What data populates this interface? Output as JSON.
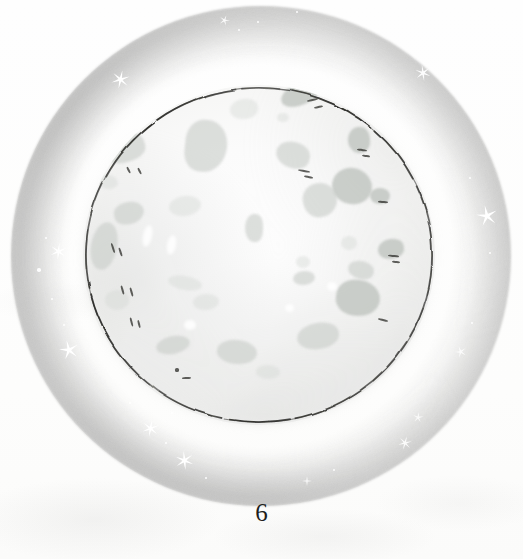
{
  "page": {
    "kind": "book-illustration",
    "number": "6",
    "background_color": "#fdfdfc"
  },
  "illustration": {
    "subject": "full-moon",
    "title_text": "",
    "caption_text": "",
    "palette": {
      "paper": "#fdfdfc",
      "halo_outer": "#acacac",
      "halo_mid": "#b4b4b4",
      "disc_fill": "#fbfbfb",
      "disc_edge": "#e6e6e4",
      "crater_gray": "#c9cdc9",
      "crater_dark": "#bcc1bc",
      "ink_line": "#2b2b28",
      "star_white": "#ffffff",
      "page_number_color": "#1e1e1c"
    },
    "halo": {
      "cx": 261,
      "cy": 256,
      "r": 250,
      "inner_r": 140
    },
    "disc": {
      "cx": 259,
      "cy": 255,
      "rx": 176,
      "ry": 170
    },
    "outline": {
      "stroke": "#2b2b28",
      "width": 1.6,
      "style": "hand-drawn-broken-ink"
    },
    "craters": [
      {
        "name": "crater-upper-left-large",
        "x": 122,
        "y": 148,
        "w": 46,
        "h": 30,
        "r": "48% 52% 40% 60%",
        "rot": -18,
        "tone": ""
      },
      {
        "name": "crater-upper-left-small",
        "x": 108,
        "y": 182,
        "w": 20,
        "h": 14,
        "r": "50%",
        "rot": 8,
        "tone": "light"
      },
      {
        "name": "crater-top-mid",
        "x": 206,
        "y": 146,
        "w": 42,
        "h": 52,
        "r": "46% 54% 58% 42%",
        "rot": 6,
        "tone": ""
      },
      {
        "name": "crater-top-center-small",
        "x": 244,
        "y": 109,
        "w": 28,
        "h": 20,
        "r": "52% 48% 46% 54%",
        "rot": -10,
        "tone": "light"
      },
      {
        "name": "crater-top-right-long",
        "x": 300,
        "y": 94,
        "w": 40,
        "h": 22,
        "r": "56% 44% 50% 50%",
        "rot": -22,
        "tone": "dark"
      },
      {
        "name": "crater-top-right-tiny",
        "x": 283,
        "y": 117,
        "w": 12,
        "h": 9,
        "r": "50%",
        "rot": 0,
        "tone": "light"
      },
      {
        "name": "crater-right-upper",
        "x": 293,
        "y": 155,
        "w": 34,
        "h": 26,
        "r": "50% 50% 44% 56%",
        "rot": 14,
        "tone": ""
      },
      {
        "name": "crater-right-ink",
        "x": 359,
        "y": 140,
        "w": 22,
        "h": 26,
        "r": "54% 46% 48% 52%",
        "rot": -6,
        "tone": "dark"
      },
      {
        "name": "crater-right-big",
        "x": 352,
        "y": 186,
        "w": 40,
        "h": 36,
        "r": "50% 52% 48% 50%",
        "rot": 10,
        "tone": "dark"
      },
      {
        "name": "crater-mid-left-blob",
        "x": 129,
        "y": 213,
        "w": 30,
        "h": 22,
        "r": "48% 52% 56% 44%",
        "rot": -12,
        "tone": ""
      },
      {
        "name": "crater-left-edge",
        "x": 104,
        "y": 246,
        "w": 26,
        "h": 48,
        "r": "52% 48% 50% 50%",
        "rot": 10,
        "tone": ""
      },
      {
        "name": "crater-center-left",
        "x": 185,
        "y": 206,
        "w": 32,
        "h": 20,
        "r": "50%",
        "rot": -8,
        "tone": "light"
      },
      {
        "name": "crater-center-drop",
        "x": 254,
        "y": 228,
        "w": 18,
        "h": 28,
        "r": "52% 48% 40% 60%",
        "rot": 4,
        "tone": ""
      },
      {
        "name": "crater-center-right",
        "x": 320,
        "y": 200,
        "w": 34,
        "h": 34,
        "r": "48% 52% 52% 48%",
        "rot": -14,
        "tone": ""
      },
      {
        "name": "crater-right-mid-ink",
        "x": 380,
        "y": 196,
        "w": 20,
        "h": 16,
        "r": "50%",
        "rot": 0,
        "tone": "dark"
      },
      {
        "name": "crater-right-lower-ink",
        "x": 391,
        "y": 249,
        "w": 26,
        "h": 20,
        "r": "54% 46% 50% 50%",
        "rot": -8,
        "tone": "dark"
      },
      {
        "name": "crater-right-lower-small",
        "x": 349,
        "y": 243,
        "w": 16,
        "h": 14,
        "r": "50%",
        "rot": 0,
        "tone": "light"
      },
      {
        "name": "crater-right-lower-two",
        "x": 361,
        "y": 270,
        "w": 26,
        "h": 18,
        "r": "50% 50% 46% 54%",
        "rot": 12,
        "tone": ""
      },
      {
        "name": "crater-center-low-small",
        "x": 303,
        "y": 262,
        "w": 14,
        "h": 12,
        "r": "50%",
        "rot": 0,
        "tone": "light"
      },
      {
        "name": "crater-lower-center",
        "x": 304,
        "y": 278,
        "w": 22,
        "h": 14,
        "r": "50%",
        "rot": -6,
        "tone": ""
      },
      {
        "name": "crater-lower-left-streak",
        "x": 185,
        "y": 283,
        "w": 34,
        "h": 14,
        "r": "50%",
        "rot": 10,
        "tone": "light"
      },
      {
        "name": "crater-lower-mid",
        "x": 206,
        "y": 302,
        "w": 26,
        "h": 16,
        "r": "50%",
        "rot": -4,
        "tone": "light"
      },
      {
        "name": "crater-bottom-right-big",
        "x": 358,
        "y": 298,
        "w": 44,
        "h": 36,
        "r": "48% 52% 54% 46%",
        "rot": 8,
        "tone": "dark"
      },
      {
        "name": "crater-bottom-right-low",
        "x": 318,
        "y": 336,
        "w": 42,
        "h": 26,
        "r": "52% 48% 48% 52%",
        "rot": -10,
        "tone": ""
      },
      {
        "name": "crater-bottom-mid",
        "x": 237,
        "y": 352,
        "w": 40,
        "h": 24,
        "r": "50% 50% 52% 48%",
        "rot": 6,
        "tone": ""
      },
      {
        "name": "crater-bottom-left",
        "x": 173,
        "y": 345,
        "w": 34,
        "h": 18,
        "r": "50%",
        "rot": -12,
        "tone": ""
      },
      {
        "name": "crater-bottom-small",
        "x": 268,
        "y": 372,
        "w": 24,
        "h": 14,
        "r": "50%",
        "rot": 2,
        "tone": "light"
      },
      {
        "name": "crater-left-low",
        "x": 117,
        "y": 300,
        "w": 24,
        "h": 20,
        "r": "50%",
        "rot": 0,
        "tone": "light"
      }
    ],
    "pen_marks": [
      {
        "name": "pen-upper-left-a",
        "x": 128,
        "y": 170,
        "w": 7,
        "h": 2.2,
        "rot": 62
      },
      {
        "name": "pen-upper-left-b",
        "x": 139,
        "y": 171,
        "w": 7,
        "h": 2.2,
        "rot": 62
      },
      {
        "name": "pen-top-right-a",
        "x": 312,
        "y": 100,
        "w": 11,
        "h": 2.2,
        "rot": -12
      },
      {
        "name": "pen-top-right-b",
        "x": 318,
        "y": 107,
        "w": 9,
        "h": 2.2,
        "rot": -12
      },
      {
        "name": "pen-right-upper-a",
        "x": 304,
        "y": 171,
        "w": 12,
        "h": 2.2,
        "rot": 10
      },
      {
        "name": "pen-right-upper-b",
        "x": 308,
        "y": 177,
        "w": 9,
        "h": 2.2,
        "rot": 10
      },
      {
        "name": "pen-right-ink-a",
        "x": 362,
        "y": 150,
        "w": 10,
        "h": 2.2,
        "rot": 8
      },
      {
        "name": "pen-right-ink-b",
        "x": 366,
        "y": 156,
        "w": 8,
        "h": 2.2,
        "rot": 8
      },
      {
        "name": "pen-right-mid-a",
        "x": 383,
        "y": 202,
        "w": 10,
        "h": 2.2,
        "rot": 4
      },
      {
        "name": "pen-right-low-a",
        "x": 393,
        "y": 256,
        "w": 11,
        "h": 2.2,
        "rot": 6
      },
      {
        "name": "pen-right-low-b",
        "x": 396,
        "y": 262,
        "w": 8,
        "h": 2.2,
        "rot": 6
      },
      {
        "name": "pen-left-edge-a",
        "x": 113,
        "y": 248,
        "w": 10,
        "h": 2.0,
        "rot": 72
      },
      {
        "name": "pen-left-edge-b",
        "x": 120,
        "y": 252,
        "w": 9,
        "h": 2.0,
        "rot": 72
      },
      {
        "name": "pen-left-low-a",
        "x": 122,
        "y": 290,
        "w": 9,
        "h": 2.0,
        "rot": 74
      },
      {
        "name": "pen-left-low-b",
        "x": 131,
        "y": 292,
        "w": 9,
        "h": 2.0,
        "rot": 74
      },
      {
        "name": "pen-bottom-left-a",
        "x": 131,
        "y": 322,
        "w": 9,
        "h": 2.0,
        "rot": 76
      },
      {
        "name": "pen-bottom-left-b",
        "x": 139,
        "y": 324,
        "w": 8,
        "h": 2.0,
        "rot": 76
      },
      {
        "name": "pen-bottom-mid-a",
        "x": 186,
        "y": 378,
        "w": 9,
        "h": 2.0,
        "rot": -4
      },
      {
        "name": "pen-bottom-dot",
        "x": 177,
        "y": 370,
        "w": 4,
        "h": 4,
        "rot": 0
      },
      {
        "name": "pen-bottom-right",
        "x": 383,
        "y": 320,
        "w": 10,
        "h": 2.0,
        "rot": 14
      }
    ],
    "highlights": [
      {
        "name": "highlight-left-a",
        "x": 147,
        "y": 236,
        "w": 9,
        "h": 22,
        "rot": 12
      },
      {
        "name": "highlight-left-b",
        "x": 171,
        "y": 245,
        "w": 9,
        "h": 20,
        "rot": 10
      },
      {
        "name": "highlight-low-a",
        "x": 190,
        "y": 325,
        "w": 12,
        "h": 10,
        "rot": 0
      },
      {
        "name": "highlight-low-b",
        "x": 332,
        "y": 286,
        "w": 10,
        "h": 9,
        "rot": 0
      },
      {
        "name": "highlight-mid-a",
        "x": 289,
        "y": 308,
        "w": 9,
        "h": 8,
        "rot": 0
      }
    ],
    "stars": [
      {
        "name": "star-top-left",
        "x": 120,
        "y": 79,
        "size": 19,
        "points": 6,
        "rot": 12,
        "opacity": 1.0
      },
      {
        "name": "star-top-right",
        "x": 423,
        "y": 73,
        "size": 16,
        "points": 6,
        "rot": -8,
        "opacity": 0.95
      },
      {
        "name": "star-top-center",
        "x": 225,
        "y": 17,
        "size": 11,
        "points": 5,
        "rot": 20,
        "opacity": 0.9
      },
      {
        "name": "star-right-mid",
        "x": 487,
        "y": 216,
        "size": 22,
        "points": 5,
        "rot": -12,
        "opacity": 1.0
      },
      {
        "name": "star-left-upper",
        "x": 58,
        "y": 251,
        "size": 17,
        "points": 6,
        "rot": 6,
        "opacity": 1.0
      },
      {
        "name": "star-left-lower",
        "x": 69,
        "y": 350,
        "size": 20,
        "points": 5,
        "rot": -14,
        "opacity": 1.0
      },
      {
        "name": "star-bottom-left",
        "x": 150,
        "y": 428,
        "size": 17,
        "points": 6,
        "rot": 10,
        "opacity": 1.0
      },
      {
        "name": "star-bottom-mid",
        "x": 184,
        "y": 460,
        "size": 19,
        "points": 6,
        "rot": -6,
        "opacity": 1.0
      },
      {
        "name": "star-bottom-right",
        "x": 405,
        "y": 443,
        "size": 14,
        "points": 6,
        "rot": 16,
        "opacity": 0.9
      },
      {
        "name": "star-right-lower",
        "x": 460,
        "y": 350,
        "size": 12,
        "points": 5,
        "rot": -20,
        "opacity": 0.85
      },
      {
        "name": "star-right-low2",
        "x": 418,
        "y": 414,
        "size": 11,
        "points": 5,
        "rot": 8,
        "opacity": 0.8
      },
      {
        "name": "star-bottom-far",
        "x": 307,
        "y": 477,
        "size": 10,
        "points": 4,
        "rot": 0,
        "opacity": 0.75
      }
    ],
    "specks": [
      {
        "name": "speck-left-a",
        "x": 39,
        "y": 270,
        "size": 3.5
      },
      {
        "name": "speck-left-b",
        "x": 46,
        "y": 238,
        "size": 2.5
      },
      {
        "name": "speck-left-c",
        "x": 52,
        "y": 299,
        "size": 2.0
      },
      {
        "name": "speck-top-a",
        "x": 239,
        "y": 30,
        "size": 2.5
      },
      {
        "name": "speck-top-b",
        "x": 258,
        "y": 22,
        "size": 2.0
      },
      {
        "name": "speck-top-c",
        "x": 297,
        "y": 12,
        "size": 2.0
      },
      {
        "name": "speck-right-a",
        "x": 470,
        "y": 178,
        "size": 2.2
      },
      {
        "name": "speck-right-b",
        "x": 490,
        "y": 253,
        "size": 2.4
      },
      {
        "name": "speck-right-c",
        "x": 472,
        "y": 323,
        "size": 2.0
      },
      {
        "name": "speck-bot-a",
        "x": 130,
        "y": 403,
        "size": 2.6
      },
      {
        "name": "speck-bot-b",
        "x": 166,
        "y": 443,
        "size": 2.2
      },
      {
        "name": "speck-bot-c",
        "x": 206,
        "y": 478,
        "size": 2.4
      },
      {
        "name": "speck-bot-d",
        "x": 334,
        "y": 470,
        "size": 2.0
      },
      {
        "name": "speck-bot-e",
        "x": 172,
        "y": 413,
        "size": 2.0
      },
      {
        "name": "speck-bot-f",
        "x": 64,
        "y": 325,
        "size": 2.2
      }
    ]
  }
}
